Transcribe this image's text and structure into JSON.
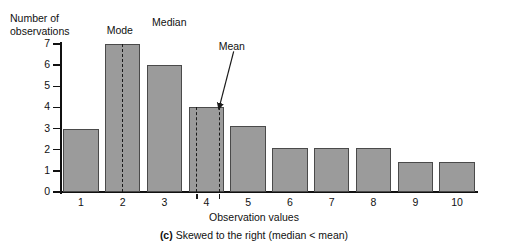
{
  "chart_data": {
    "type": "bar",
    "title": "",
    "subtitle": "",
    "xlabel": "Observation values",
    "ylabel": "Number of observations",
    "categories": [
      "1",
      "2",
      "3",
      "4",
      "5",
      "6",
      "7",
      "8",
      "9",
      "10"
    ],
    "values": [
      3,
      7,
      6,
      4,
      3.1,
      2.1,
      2.1,
      2.1,
      1.4,
      1.4
    ],
    "ylim": [
      0,
      7
    ],
    "yticks": [
      "0",
      "1",
      "2",
      "3",
      "4",
      "5",
      "6",
      "7"
    ],
    "grid": false,
    "legend": "none",
    "bar_color": "#9b9b9b",
    "bar_edge_color": "#4a4a4a",
    "annotations": [
      {
        "name": "Mode",
        "label": "Mode",
        "x_value": 2.0
      },
      {
        "name": "Median",
        "label": "Median",
        "x_value": 3.78
      },
      {
        "name": "Mean",
        "label": "Mean",
        "x_value": 4.32
      }
    ],
    "caption_prefix": "(c)",
    "caption_text": "Skewed to the right (median < mean)"
  },
  "axis": {
    "ylabel_line1": "Number of",
    "ylabel_line2": "observations"
  }
}
